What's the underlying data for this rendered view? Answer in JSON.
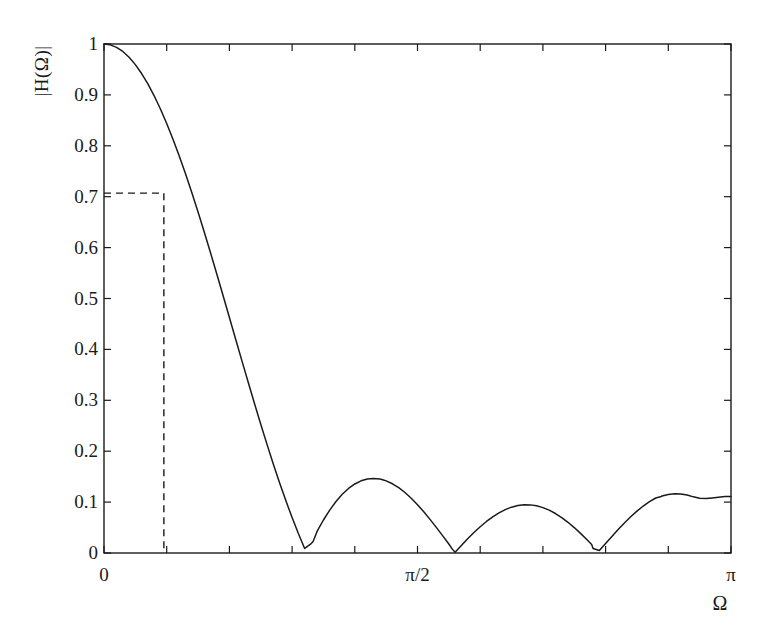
{
  "chart_data": {
    "type": "line",
    "title": "",
    "xlabel": "Ω",
    "ylabel": "|H(Ω)|",
    "xlim": [
      0,
      3.141592653589793
    ],
    "ylim": [
      0,
      1
    ],
    "grid": false,
    "legend": null,
    "x_tick_labels": [
      "0",
      "π/2",
      "π"
    ],
    "x_tick_values": [
      0,
      1.5707963267948966,
      3.141592653589793
    ],
    "x_minor_tick_values": [
      0.3141592653589793,
      0.6283185307179586,
      0.9424777960769379,
      1.2566370614359172,
      1.8849555921538759,
      2.199114857512855,
      2.5132741228718345,
      2.827433388230814
    ],
    "y_tick_labels": [
      "0",
      "0.1",
      "0.2",
      "0.3",
      "0.4",
      "0.5",
      "0.6",
      "0.7",
      "0.8",
      "0.9",
      "1"
    ],
    "y_tick_values": [
      0,
      0.1,
      0.2,
      0.3,
      0.4,
      0.5,
      0.6,
      0.7,
      0.8,
      0.9,
      1.0
    ],
    "filter_length": 9,
    "cutoff_marker": {
      "style": "dashed",
      "y_value": 0.707,
      "x_value": 0.3
    },
    "nulls_x": [
      0.6981317007977318,
      1.3962634015954636,
      2.0943951023931953,
      2.792526803190927
    ],
    "sidelobe_peaks": [
      {
        "x": 1.0471975511965976,
        "y": 0.2222
      },
      {
        "x": 1.7453292519943295,
        "y": 0.1451
      },
      {
        "x": 2.443460952792061,
        "y": 0.1194
      },
      {
        "x": 3.141592653589793,
        "y": 0.1111
      }
    ],
    "series": [
      {
        "name": "|H(Ω)|",
        "color": "#1a1a1a",
        "x": [
          0,
          0.0314159,
          0.0628319,
          0.0942478,
          0.1256637,
          0.1570796,
          0.1884956,
          0.2199115,
          0.2513274,
          0.2827433,
          0.3141593,
          0.3455752,
          0.3769911,
          0.408407,
          0.439823,
          0.4712389,
          0.5026548,
          0.5340708,
          0.5654867,
          0.5969026,
          0.6283185,
          0.6597345,
          0.6911504,
          0.6981317,
          0.7225663,
          0.7539822,
          0.7853982,
          0.8168141,
          0.84823,
          0.8796459,
          0.9110619,
          0.9424778,
          0.9738937,
          1.0053096,
          1.0367256,
          1.0471976,
          1.0681415,
          1.0995574,
          1.1309734,
          1.1623893,
          1.1938052,
          1.2252211,
          1.2566371,
          1.288053,
          1.3194689,
          1.3508848,
          1.3823008,
          1.3962634,
          1.4137167,
          1.4451326,
          1.4765485,
          1.5079645,
          1.5393804,
          1.5707963,
          1.6022123,
          1.6336282,
          1.6650441,
          1.69646,
          1.727876,
          1.7453293,
          1.7592919,
          1.7907078,
          1.8221237,
          1.8535397,
          1.8849556,
          1.9163715,
          1.9477874,
          1.9792034,
          2.0106193,
          2.0420352,
          2.0734512,
          2.0943951,
          2.1048671,
          2.136283,
          2.167699,
          2.1991149,
          2.2305308,
          2.2619467,
          2.2933627,
          2.3247786,
          2.3561945,
          2.3876104,
          2.4190264,
          2.443461,
          2.4504423,
          2.4818582,
          2.5132741,
          2.54469,
          2.576106,
          2.6075219,
          2.6389378,
          2.6703538,
          2.7017697,
          2.7331856,
          2.7646015,
          2.7925268,
          2.7960175,
          2.8274334,
          2.8588493,
          2.8902652,
          2.9216812,
          2.9530971,
          2.984513,
          3.0159289,
          3.0473449,
          3.0787608,
          3.1101767,
          3.1415927
        ],
        "y": [
          1.0,
          0.99836,
          0.99345,
          0.9853,
          0.97396,
          0.95949,
          0.94198,
          0.92153,
          0.89826,
          0.8723,
          0.84382,
          0.81297,
          0.77994,
          0.74492,
          0.70813,
          0.66977,
          0.63008,
          0.5893,
          0.54766,
          0.50541,
          0.46281,
          0.4201,
          0.37752,
          0.36815,
          0.33533,
          0.29374,
          0.25301,
          0.21336,
          0.175,
          0.13812,
          0.10291,
          0.06953,
          0.03815,
          0.00889,
          0.01811,
          0.02222,
          0.04278,
          0.06483,
          0.0843,
          0.10113,
          0.1153,
          0.12679,
          0.13561,
          0.1418,
          0.14541,
          0.14652,
          0.14523,
          0.14406,
          0.14165,
          0.136,
          0.12834,
          0.11881,
          0.10761,
          0.09493,
          0.081,
          0.06606,
          0.05036,
          0.03416,
          0.01774,
          0.0076,
          0.00136,
          0.01483,
          0.02783,
          0.04015,
          0.05159,
          0.06197,
          0.07113,
          0.07893,
          0.08527,
          0.09005,
          0.09321,
          0.0943,
          0.09471,
          0.09453,
          0.09268,
          0.0892,
          0.08414,
          0.07757,
          0.0696,
          0.06035,
          0.04996,
          0.03859,
          0.02642,
          0.01677,
          0.00893,
          0.00478,
          0.01864,
          0.03246,
          0.04597,
          0.05893,
          0.0711,
          0.08228,
          0.09228,
          0.10092,
          0.10808,
          0.11111,
          0.11215,
          0.1151,
          0.11638,
          0.11598,
          0.11393,
          0.11031,
          0.10756,
          0.10691,
          0.10823,
          0.10973,
          0.11077,
          0.11111
        ]
      }
    ]
  },
  "axes": {
    "tick_color": "#1a1a1a",
    "frame_color": "#1a1a1a",
    "background": "#ffffff",
    "curve_color": "#1a1a1a",
    "dash_color": "#1a1a1a"
  }
}
